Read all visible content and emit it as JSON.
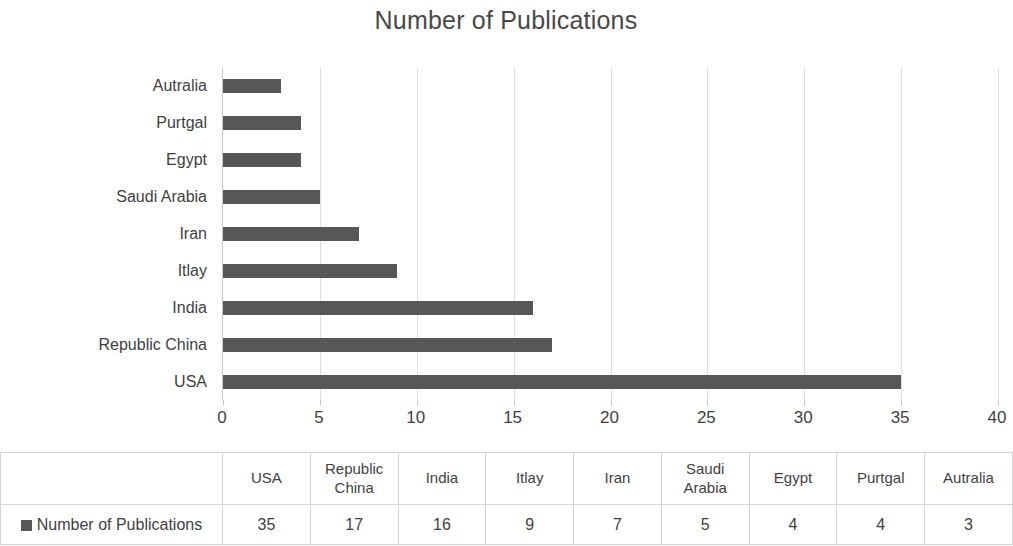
{
  "chart_data": {
    "type": "bar",
    "orientation": "horizontal",
    "title": "Number of Publications",
    "xlabel": "",
    "ylabel": "",
    "categories": [
      "USA",
      "Republic China",
      "India",
      "Itlay",
      "Iran",
      "Saudi Arabia",
      "Egypt",
      "Purtgal",
      "Autralia"
    ],
    "values": [
      35,
      17,
      16,
      9,
      7,
      5,
      4,
      4,
      3
    ],
    "series": [
      {
        "name": "Number of Publications",
        "values": [
          35,
          17,
          16,
          9,
          7,
          5,
          4,
          4,
          3
        ],
        "color": "#575757"
      }
    ],
    "xlim": [
      0,
      40
    ],
    "xticks": [
      "0",
      "5",
      "10",
      "15",
      "20",
      "25",
      "30",
      "35",
      "40"
    ],
    "xtick_values": [
      0,
      5,
      10,
      15,
      20,
      25,
      30,
      35,
      40
    ],
    "grid": "vertical",
    "legend_position": "data-table",
    "bar_color": "#575757",
    "gridline_color": "#dedede",
    "axis_color": "#c9c9c9",
    "text_color": "#3f3f3f"
  },
  "data_table": {
    "show": true,
    "series_label": "Number of Publications",
    "legend_marker": "square-swatch",
    "column_headers": [
      "USA",
      "Republic China",
      "India",
      "Itlay",
      "Iran",
      "Saudi Arabia",
      "Egypt",
      "Purtgal",
      "Autralia"
    ],
    "row_values": [
      "35",
      "17",
      "16",
      "9",
      "7",
      "5",
      "4",
      "4",
      "3"
    ]
  }
}
